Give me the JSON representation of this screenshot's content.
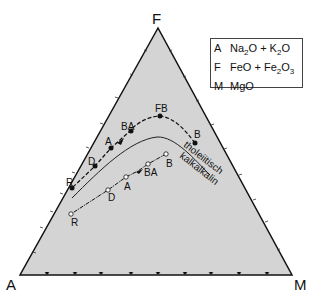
{
  "diagram": {
    "type": "AFM ternary diagram",
    "vertices": {
      "top": "F",
      "left": "A",
      "right": "M"
    },
    "legend": [
      {
        "key": "A",
        "value": "Na2O + K2O"
      },
      {
        "key": "F",
        "value": "FeO + Fe2O3"
      },
      {
        "key": "M",
        "value": "MgO"
      }
    ],
    "divider_labels": {
      "upper": "tholeiitisch",
      "lower": "kalkalkalin"
    },
    "tholeiitic_series": [
      "B",
      "FB",
      "BA",
      "A",
      "D",
      "R"
    ],
    "calc_alkaline_series": [
      "B",
      "BA",
      "A",
      "D",
      "R"
    ],
    "colors": {
      "fill": "#d4d4d4",
      "stroke": "#111111"
    }
  }
}
